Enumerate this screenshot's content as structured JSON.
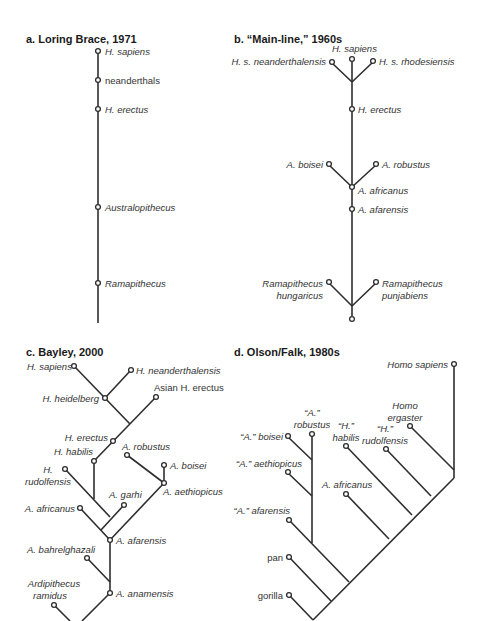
{
  "figure": {
    "panels": [
      {
        "id": "a",
        "title": "a.  Loring Brace, 1971",
        "type": "single-lineage",
        "taxa": [
          "H. sapiens",
          "neanderthals",
          "H. erectus",
          "Australopithecus",
          "Ramapithecus"
        ]
      },
      {
        "id": "b",
        "title": "b.  “Main-line,” 1960s",
        "type": "main-line-with-side-branches",
        "taxa": [
          "H. sapiens",
          "H. s. neanderthalensis",
          "H. s. rhodesiensis",
          "H. erectus",
          "A. boisei",
          "A. robustus",
          "A. africanus",
          "A. afarensis",
          "Ramapithecus hungaricus",
          "Ramapithecus punjabiens"
        ]
      },
      {
        "id": "c",
        "title": "c.  Bayley, 2000",
        "type": "branching-tree",
        "taxa": [
          "H. sapiens",
          "H. neanderthalensis",
          "H. heidelberg",
          "Asian H. erectus",
          "H. erectus",
          "A. robustus",
          "H. habilis",
          "A. boisei",
          "H. rudolfensis",
          "A. aethiopicus",
          "A. garhi",
          "A. africanus",
          "A. afarensis",
          "A. bahrelghazali",
          "A. anamensis",
          "Ardipithecus ramidus"
        ]
      },
      {
        "id": "d",
        "title": "d.  Olson/Falk, 1980s",
        "type": "cladogram",
        "taxa": [
          "Homo sapiens",
          "Homo ergaster",
          "“H.” rudolfensis",
          "“H.” habilis",
          "“A.” robustus",
          "“A.” boisei",
          "“A.” aethiopicus",
          "A. africanus",
          "“A.” afarensis",
          "pan",
          "gorilla"
        ]
      }
    ]
  },
  "a": {
    "title": "a.  Loring Brace, 1971",
    "labels": {
      "sapiens": "H. sapiens",
      "neanderthals": "neanderthals",
      "erectus": "H. erectus",
      "australopithecus": "Australopithecus",
      "ramapithecus": "Ramapithecus"
    }
  },
  "b": {
    "title": "b.  “Main-line,” 1960s",
    "labels": {
      "sapiens": "H. sapiens",
      "neanderthalensis": "H. s. neanderthalensis",
      "rhodesiensis": "H. s. rhodesiensis",
      "erectus": "H. erectus",
      "boisei": "A. boisei",
      "robustus": "A. robustus",
      "africanus": "A. africanus",
      "afarensis": "A. afarensis",
      "rama_h1": "Ramapithecus",
      "rama_h2": "hungaricus",
      "rama_p1": "Ramapithecus",
      "rama_p2": "punjabiens"
    }
  },
  "c": {
    "title": "c.  Bayley, 2000",
    "labels": {
      "sapiens": "H. sapiens",
      "neanderthalensis": "H. neanderthalensis",
      "heidelberg": "H. heidelberg",
      "asian_erectus": "Asian H. erectus",
      "erectus": "H. erectus",
      "robustus": "A. robustus",
      "habilis": "H. habilis",
      "boisei": "A. boisei",
      "rudolfensis1": "H.",
      "rudolfensis2": "rudolfensis",
      "aethiopicus": "A. aethiopicus",
      "garhi": "A. garhi",
      "africanus": "A. africanus",
      "afarensis": "A. afarensis",
      "bahrelghazali": "A. bahrelghazali",
      "anamensis": "A. anamensis",
      "ramidus1": "Ardipithecus",
      "ramidus2": "ramidus"
    }
  },
  "d": {
    "title": "d.  Olson/Falk, 1980s",
    "labels": {
      "sapiens": "Homo sapiens",
      "ergaster1": "Homo",
      "ergaster2": "ergaster",
      "rudolfensis1": "“H.”",
      "rudolfensis2": "rudolfensis",
      "habilis1": "“H.”",
      "habilis2": "habilis",
      "robustus1": "“A.”",
      "robustus2": "robustus",
      "boisei": "“A.” boisei",
      "aethiopicus": "“A.” aethiopicus",
      "africanus": "A. africanus",
      "afarensis": "“A.” afarensis",
      "pan": "pan",
      "gorilla": "gorilla"
    }
  }
}
